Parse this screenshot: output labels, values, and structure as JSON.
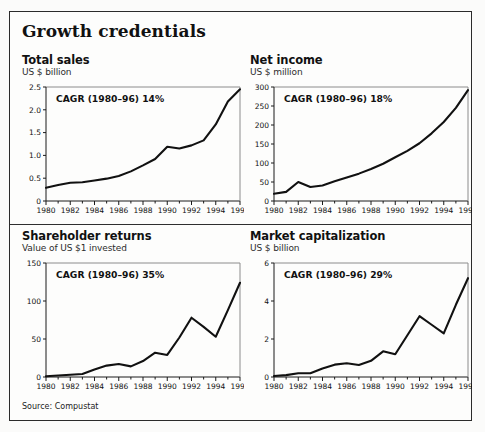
{
  "exhibit": {
    "title": "Growth credentials",
    "source": "Source: Compustat"
  },
  "panels": [
    {
      "key": "total-sales",
      "title": "Total sales",
      "subtitle": "US $ billion",
      "cagr": "CAGR (1980–96) 14%"
    },
    {
      "key": "net-income",
      "title": "Net income",
      "subtitle": "US $ million",
      "cagr": "CAGR (1980–96) 18%"
    },
    {
      "key": "shareholder-returns",
      "title": "Shareholder returns",
      "subtitle": "Value of US $1 invested",
      "cagr": "CAGR (1980–96) 35%"
    },
    {
      "key": "market-capitalization",
      "title": "Market capitalization",
      "subtitle": "US $ billion",
      "cagr": "CAGR (1980–96) 29%"
    }
  ],
  "chart_data": [
    {
      "type": "line",
      "title": "Total sales",
      "subtitle": "US $ billion",
      "annotation": "CAGR (1980–96) 14%",
      "xlabel": "",
      "ylabel": "US $ billion",
      "x": [
        1980,
        1981,
        1982,
        1983,
        1984,
        1985,
        1986,
        1987,
        1988,
        1989,
        1990,
        1991,
        1992,
        1993,
        1994,
        1995,
        1996
      ],
      "values": [
        0.29,
        0.35,
        0.4,
        0.41,
        0.45,
        0.49,
        0.55,
        0.65,
        0.78,
        0.92,
        1.19,
        1.15,
        1.22,
        1.33,
        1.68,
        2.18,
        2.45
      ],
      "ylim": [
        0,
        2.5
      ],
      "yticks": [
        0,
        0.5,
        1.0,
        1.5,
        2.0,
        2.5
      ],
      "yticklabels": [
        "0",
        "0.5",
        "1.0",
        "1.5",
        "2.0",
        "2.5"
      ],
      "xticks": [
        1980,
        1982,
        1984,
        1986,
        1988,
        1990,
        1992,
        1994,
        1996
      ],
      "xticklabels": [
        "1980",
        "1982",
        "1984",
        "1986",
        "1988",
        "1990",
        "1992",
        "1994",
        "1996"
      ],
      "grid": false,
      "legend": "none",
      "line_color": "#111111"
    },
    {
      "type": "line",
      "title": "Net income",
      "subtitle": "US $ million",
      "annotation": "CAGR (1980–96) 18%",
      "xlabel": "",
      "ylabel": "US $ million",
      "x": [
        1980,
        1981,
        1982,
        1983,
        1984,
        1985,
        1986,
        1987,
        1988,
        1989,
        1990,
        1991,
        1992,
        1993,
        1994,
        1995,
        1996
      ],
      "values": [
        19,
        24,
        50,
        37,
        41,
        52,
        62,
        72,
        84,
        98,
        115,
        132,
        152,
        178,
        208,
        245,
        292
      ],
      "ylim": [
        0,
        300
      ],
      "yticks": [
        0,
        50,
        100,
        150,
        200,
        250,
        300
      ],
      "yticklabels": [
        "0",
        "50",
        "100",
        "150",
        "200",
        "250",
        "300"
      ],
      "xticks": [
        1980,
        1982,
        1984,
        1986,
        1988,
        1990,
        1992,
        1994,
        1996
      ],
      "xticklabels": [
        "1980",
        "1982",
        "1984",
        "1986",
        "1988",
        "1990",
        "1992",
        "1994",
        "1996"
      ],
      "grid": false,
      "legend": "none",
      "line_color": "#111111"
    },
    {
      "type": "line",
      "title": "Shareholder returns",
      "subtitle": "Value of US $1 invested",
      "annotation": "CAGR (1980–96) 35%",
      "xlabel": "",
      "ylabel": "Value of US $1 invested",
      "x": [
        1980,
        1981,
        1982,
        1983,
        1984,
        1985,
        1986,
        1987,
        1988,
        1989,
        1990,
        1991,
        1992,
        1993,
        1994,
        1995,
        1996
      ],
      "values": [
        1,
        2,
        3,
        4,
        10,
        15,
        17,
        14,
        21,
        32,
        29,
        52,
        78,
        66,
        53,
        88,
        124
      ],
      "ylim": [
        0,
        150
      ],
      "yticks": [
        0,
        50,
        100,
        150
      ],
      "yticklabels": [
        "0",
        "50",
        "100",
        "150"
      ],
      "xticks": [
        1980,
        1982,
        1984,
        1986,
        1988,
        1990,
        1992,
        1994,
        1996
      ],
      "xticklabels": [
        "1980",
        "1982",
        "1984",
        "1986",
        "1988",
        "1990",
        "1992",
        "1994",
        "1996"
      ],
      "grid": false,
      "legend": "none",
      "line_color": "#111111"
    },
    {
      "type": "line",
      "title": "Market capitalization",
      "subtitle": "US $ billion",
      "annotation": "CAGR (1980–96) 29%",
      "xlabel": "",
      "ylabel": "US $ billion",
      "x": [
        1980,
        1981,
        1982,
        1983,
        1984,
        1985,
        1986,
        1987,
        1988,
        1989,
        1990,
        1991,
        1992,
        1993,
        1994,
        1995,
        1996
      ],
      "values": [
        0.05,
        0.1,
        0.2,
        0.2,
        0.45,
        0.65,
        0.72,
        0.63,
        0.85,
        1.35,
        1.2,
        2.2,
        3.2,
        2.75,
        2.3,
        3.8,
        5.2
      ],
      "ylim": [
        0,
        6
      ],
      "yticks": [
        0,
        2,
        4,
        6
      ],
      "yticklabels": [
        "0",
        "2",
        "4",
        "6"
      ],
      "xticks": [
        1980,
        1982,
        1984,
        1986,
        1988,
        1990,
        1992,
        1994,
        1996
      ],
      "xticklabels": [
        "1980",
        "1982",
        "1984",
        "1986",
        "1988",
        "1990",
        "1992",
        "1994",
        "1996"
      ],
      "grid": false,
      "legend": "none",
      "line_color": "#111111"
    }
  ]
}
